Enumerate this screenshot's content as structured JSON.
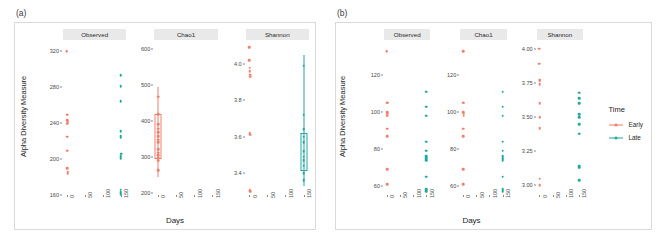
{
  "figure": {
    "panel_a_tag": "(a)",
    "panel_b_tag": "(b)",
    "xlabel": "Days",
    "ylabel": "Alpha Diversity Measure"
  },
  "legend": {
    "title": "Time",
    "items": [
      {
        "label": "Early",
        "color": "#F07F6E"
      },
      {
        "label": "Late",
        "color": "#1FA8A0"
      }
    ]
  },
  "facets": [
    {
      "label": "Observed"
    },
    {
      "label": "Chao1"
    },
    {
      "label": "Shannon"
    }
  ],
  "x_ticks": [
    "0",
    "50",
    "100",
    "150"
  ],
  "chart_data": [
    {
      "type": "scatter",
      "panel": "(a)",
      "title": "Alpha diversity by Days and Time (panel a)",
      "xlabel": "Days",
      "ylabel": "Alpha Diversity Measure",
      "grid": false,
      "legend_position": "right",
      "facets": [
        {
          "name": "Observed",
          "ylim": [
            160,
            330
          ],
          "yticks": [
            160,
            200,
            240,
            280,
            320
          ],
          "xlim": [
            -10,
            165
          ],
          "xticks": [
            0,
            50,
            100,
            150
          ],
          "series": [
            {
              "name": "Early",
              "color": "#F07F6E",
              "points": [
                {
                  "x": 0,
                  "y": 320
                },
                {
                  "x": 1,
                  "y": 249
                },
                {
                  "x": 2,
                  "y": 243
                },
                {
                  "x": 3,
                  "y": 241
                },
                {
                  "x": 2,
                  "y": 239
                },
                {
                  "x": 1,
                  "y": 225
                },
                {
                  "x": 2,
                  "y": 209
                },
                {
                  "x": 2,
                  "y": 190
                },
                {
                  "x": 3,
                  "y": 186
                },
                {
                  "x": 3,
                  "y": 184
                }
              ]
            },
            {
              "name": "Late",
              "color": "#1FA8A0",
              "points": [
                {
                  "x": 150,
                  "y": 293
                },
                {
                  "x": 150,
                  "y": 281
                },
                {
                  "x": 150,
                  "y": 264
                },
                {
                  "x": 150,
                  "y": 231
                },
                {
                  "x": 150,
                  "y": 226
                },
                {
                  "x": 150,
                  "y": 224
                },
                {
                  "x": 151,
                  "y": 206
                },
                {
                  "x": 150,
                  "y": 203
                },
                {
                  "x": 150,
                  "y": 201
                },
                {
                  "x": 150,
                  "y": 166
                },
                {
                  "x": 150,
                  "y": 163
                },
                {
                  "x": 150,
                  "y": 161
                }
              ]
            }
          ]
        },
        {
          "name": "Chao1",
          "ylim": [
            195,
            620
          ],
          "yticks": [
            200,
            300,
            400,
            500,
            600
          ],
          "xlim": [
            -10,
            165
          ],
          "xticks": [
            0,
            50,
            100,
            150
          ],
          "series": [
            {
              "name": "Early",
              "color": "#F07F6E",
              "box": {
                "x": 0,
                "lower": 300,
                "upper": 420,
                "median": 350,
                "whisker_low": 245,
                "whisker_high": 495
              },
              "points": [
                {
                  "x": 0,
                  "y": 468
                },
                {
                  "x": 1,
                  "y": 419
                },
                {
                  "x": 1,
                  "y": 392
                },
                {
                  "x": 0,
                  "y": 379
                },
                {
                  "x": 1,
                  "y": 370
                },
                {
                  "x": 1,
                  "y": 358
                },
                {
                  "x": 0,
                  "y": 349
                },
                {
                  "x": 1,
                  "y": 341
                },
                {
                  "x": 0,
                  "y": 322
                },
                {
                  "x": 1,
                  "y": 313
                },
                {
                  "x": 0,
                  "y": 305
                },
                {
                  "x": 1,
                  "y": 298
                },
                {
                  "x": 0,
                  "y": 290
                },
                {
                  "x": 0,
                  "y": 264
                }
              ]
            },
            {
              "name": "Late",
              "color": "#1FA8A0",
              "points": []
            }
          ]
        },
        {
          "name": "Shannon",
          "ylim": [
            3.28,
            4.12
          ],
          "yticks": [
            3.4,
            3.6,
            3.8,
            4.0
          ],
          "xlim": [
            -10,
            165
          ],
          "xticks": [
            0,
            50,
            100,
            150
          ],
          "series": [
            {
              "name": "Early",
              "color": "#F07F6E",
              "points": [
                {
                  "x": 0,
                  "y": 4.09
                },
                {
                  "x": 0,
                  "y": 4.02
                },
                {
                  "x": 1,
                  "y": 3.98
                },
                {
                  "x": 1,
                  "y": 3.96
                },
                {
                  "x": 2,
                  "y": 3.94
                },
                {
                  "x": 2,
                  "y": 3.93
                },
                {
                  "x": 1,
                  "y": 3.62
                },
                {
                  "x": 2,
                  "y": 3.61
                },
                {
                  "x": 1,
                  "y": 3.31
                },
                {
                  "x": 2,
                  "y": 3.3
                }
              ]
            },
            {
              "name": "Late",
              "color": "#1FA8A0",
              "box": {
                "x": 150,
                "lower": 3.42,
                "upper": 3.62,
                "median": 3.5,
                "whisker_low": 3.33,
                "whisker_high": 4.05
              },
              "points": [
                {
                  "x": 150,
                  "y": 3.99
                },
                {
                  "x": 150,
                  "y": 3.72
                },
                {
                  "x": 150,
                  "y": 3.64
                },
                {
                  "x": 150,
                  "y": 3.6
                },
                {
                  "x": 150,
                  "y": 3.57
                },
                {
                  "x": 150,
                  "y": 3.52
                },
                {
                  "x": 150,
                  "y": 3.49
                },
                {
                  "x": 150,
                  "y": 3.47
                },
                {
                  "x": 150,
                  "y": 3.44
                },
                {
                  "x": 150,
                  "y": 3.4
                },
                {
                  "x": 150,
                  "y": 3.36
                }
              ]
            }
          ]
        }
      ]
    },
    {
      "type": "scatter",
      "panel": "(b)",
      "title": "Alpha diversity by Days and Time (panel b)",
      "xlabel": "Days",
      "ylabel": "Alpha Diversity Measure",
      "grid": false,
      "legend_position": "right",
      "facets": [
        {
          "name": "Observed",
          "ylim": [
            55,
            138
          ],
          "yticks": [
            60,
            80,
            100,
            120
          ],
          "xlim": [
            -10,
            165
          ],
          "xticks": [
            0,
            50,
            100,
            150
          ],
          "series": [
            {
              "name": "Early",
              "color": "#F07F6E",
              "points": [
                {
                  "x": 0,
                  "y": 133
                },
                {
                  "x": 1,
                  "y": 105
                },
                {
                  "x": 3,
                  "y": 105
                },
                {
                  "x": 1,
                  "y": 100
                },
                {
                  "x": 2,
                  "y": 99
                },
                {
                  "x": 3,
                  "y": 98
                },
                {
                  "x": 1,
                  "y": 91
                },
                {
                  "x": 1,
                  "y": 87
                },
                {
                  "x": 1,
                  "y": 69
                },
                {
                  "x": 1,
                  "y": 61
                }
              ]
            },
            {
              "name": "Late",
              "color": "#1FA8A0",
              "points": [
                {
                  "x": 150,
                  "y": 111
                },
                {
                  "x": 150,
                  "y": 103
                },
                {
                  "x": 150,
                  "y": 98
                },
                {
                  "x": 150,
                  "y": 84
                },
                {
                  "x": 150,
                  "y": 79
                },
                {
                  "x": 150,
                  "y": 76
                },
                {
                  "x": 150,
                  "y": 75
                },
                {
                  "x": 150,
                  "y": 74
                },
                {
                  "x": 150,
                  "y": 65
                },
                {
                  "x": 150,
                  "y": 58
                },
                {
                  "x": 150,
                  "y": 57
                }
              ]
            }
          ]
        },
        {
          "name": "Chao1",
          "ylim": [
            55,
            138
          ],
          "yticks": [
            60,
            80,
            100,
            120
          ],
          "xlim": [
            -10,
            165
          ],
          "xticks": [
            0,
            50,
            100,
            150
          ],
          "series": [
            {
              "name": "Early",
              "color": "#F07F6E",
              "points": [
                {
                  "x": 0,
                  "y": 133
                },
                {
                  "x": 1,
                  "y": 105
                },
                {
                  "x": 3,
                  "y": 105
                },
                {
                  "x": 1,
                  "y": 100
                },
                {
                  "x": 2,
                  "y": 99
                },
                {
                  "x": 3,
                  "y": 98
                },
                {
                  "x": 1,
                  "y": 91
                },
                {
                  "x": 1,
                  "y": 87
                },
                {
                  "x": 1,
                  "y": 69
                },
                {
                  "x": 1,
                  "y": 61
                }
              ]
            },
            {
              "name": "Late",
              "color": "#1FA8A0",
              "points": [
                {
                  "x": 150,
                  "y": 111
                },
                {
                  "x": 150,
                  "y": 103
                },
                {
                  "x": 150,
                  "y": 98
                },
                {
                  "x": 150,
                  "y": 84
                },
                {
                  "x": 150,
                  "y": 79
                },
                {
                  "x": 150,
                  "y": 76
                },
                {
                  "x": 150,
                  "y": 75
                },
                {
                  "x": 150,
                  "y": 74
                },
                {
                  "x": 150,
                  "y": 65
                },
                {
                  "x": 150,
                  "y": 58
                },
                {
                  "x": 150,
                  "y": 57
                }
              ]
            }
          ]
        },
        {
          "name": "Shannon",
          "ylim": [
            2.93,
            4.05
          ],
          "yticks": [
            3.0,
            3.25,
            3.5,
            3.75,
            4.0
          ],
          "xlim": [
            -10,
            165
          ],
          "xticks": [
            0,
            50,
            100,
            150
          ],
          "series": [
            {
              "name": "Early",
              "color": "#F07F6E",
              "points": [
                {
                  "x": 0,
                  "y": 4.0
                },
                {
                  "x": 0,
                  "y": 3.89
                },
                {
                  "x": 1,
                  "y": 3.77
                },
                {
                  "x": 2,
                  "y": 3.77
                },
                {
                  "x": 1,
                  "y": 3.74
                },
                {
                  "x": 1,
                  "y": 3.6
                },
                {
                  "x": 1,
                  "y": 3.5
                },
                {
                  "x": 1,
                  "y": 3.42
                },
                {
                  "x": 1,
                  "y": 3.05
                },
                {
                  "x": 1,
                  "y": 3.0
                }
              ]
            },
            {
              "name": "Late",
              "color": "#1FA8A0",
              "points": [
                {
                  "x": 150,
                  "y": 3.68
                },
                {
                  "x": 150,
                  "y": 3.64
                },
                {
                  "x": 150,
                  "y": 3.6
                },
                {
                  "x": 150,
                  "y": 3.52
                },
                {
                  "x": 151,
                  "y": 3.5
                },
                {
                  "x": 150,
                  "y": 3.45
                },
                {
                  "x": 150,
                  "y": 3.38
                },
                {
                  "x": 150,
                  "y": 3.14
                },
                {
                  "x": 151,
                  "y": 3.13
                },
                {
                  "x": 150,
                  "y": 3.04
                }
              ]
            }
          ]
        }
      ]
    }
  ]
}
